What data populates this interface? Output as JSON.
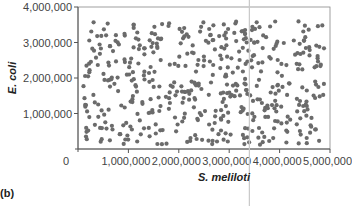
{
  "panel_label": "(b)",
  "colors": {
    "dot": "#6b6b6b",
    "axis": "#555555",
    "frame": "#888888",
    "marker_line": "#c8c8c8"
  },
  "chart_data": {
    "type": "scatter",
    "title": "",
    "xlabel": "S. meliloti",
    "ylabel": "E. coli",
    "xlim": [
      0,
      5000000
    ],
    "ylim": [
      0,
      4000000
    ],
    "x_ticks": [
      0,
      1000000,
      2000000,
      3000000,
      4000000,
      5000000
    ],
    "x_tick_labels": [
      "0",
      "1,000,000",
      "2,000,000",
      "3,000,000",
      "4,000,000",
      "5,000,000"
    ],
    "y_ticks": [
      1000000,
      2000000,
      3000000,
      4000000
    ],
    "y_tick_labels": [
      "1,000,000",
      "2,000,000",
      "3,000,000",
      "4,000,000"
    ],
    "grid": false,
    "legend": null,
    "annotations": [
      {
        "type": "vertical-line",
        "x": 3400000
      }
    ],
    "point_count_estimate": 500,
    "series": [
      {
        "name": "cells",
        "points": []
      }
    ]
  }
}
